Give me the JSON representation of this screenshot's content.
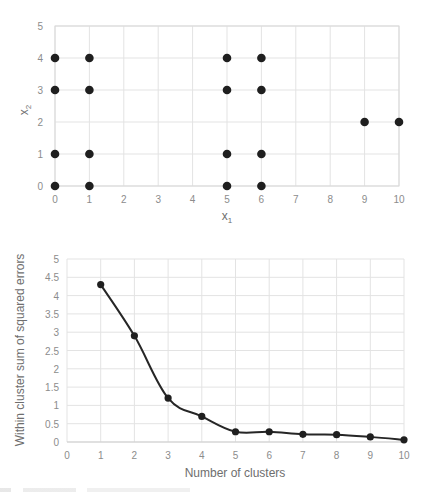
{
  "chart_data": [
    {
      "type": "scatter",
      "title": "",
      "xlabel": "x1",
      "xlabel_main": "x",
      "xlabel_sub": "1",
      "ylabel": "x2",
      "ylabel_main": "x",
      "ylabel_sub": "2",
      "xlim": [
        0,
        10
      ],
      "ylim": [
        0,
        5
      ],
      "xticks": [
        "0",
        "1",
        "2",
        "3",
        "4",
        "5",
        "6",
        "7",
        "8",
        "9",
        "10"
      ],
      "yticks": [
        "0",
        "1",
        "2",
        "3",
        "4",
        "5"
      ],
      "grid": true,
      "legend": null,
      "points": [
        {
          "x": 0,
          "y": 0
        },
        {
          "x": 0,
          "y": 1
        },
        {
          "x": 0,
          "y": 3
        },
        {
          "x": 0,
          "y": 4
        },
        {
          "x": 1,
          "y": 0
        },
        {
          "x": 1,
          "y": 1
        },
        {
          "x": 1,
          "y": 3
        },
        {
          "x": 1,
          "y": 4
        },
        {
          "x": 5,
          "y": 0
        },
        {
          "x": 5,
          "y": 1
        },
        {
          "x": 5,
          "y": 3
        },
        {
          "x": 5,
          "y": 4
        },
        {
          "x": 6,
          "y": 0
        },
        {
          "x": 6,
          "y": 1
        },
        {
          "x": 6,
          "y": 3
        },
        {
          "x": 6,
          "y": 4
        },
        {
          "x": 9,
          "y": 2
        },
        {
          "x": 10,
          "y": 2
        }
      ],
      "marker_color": "#1f1f1f"
    },
    {
      "type": "line",
      "title": "",
      "xlabel": "Number of clusters",
      "ylabel": "Within cluster sum of squared errors",
      "xlim": [
        0,
        10
      ],
      "ylim": [
        0,
        5
      ],
      "xticks": [
        "0",
        "1",
        "2",
        "3",
        "4",
        "5",
        "6",
        "7",
        "8",
        "9",
        "10"
      ],
      "yticks": [
        "0",
        "0.5",
        "1",
        "1.5",
        "2",
        "2.5",
        "3",
        "3.5",
        "4",
        "4.5",
        "5"
      ],
      "grid": true,
      "legend": null,
      "smoothed": true,
      "x": [
        1,
        2,
        3,
        4,
        5,
        6,
        7,
        8,
        9,
        10
      ],
      "series": [
        {
          "name": "SSE",
          "values": [
            4.3,
            2.9,
            1.2,
            0.7,
            0.28,
            0.28,
            0.21,
            0.2,
            0.14,
            0.06
          ],
          "color": "#262626"
        }
      ]
    }
  ]
}
